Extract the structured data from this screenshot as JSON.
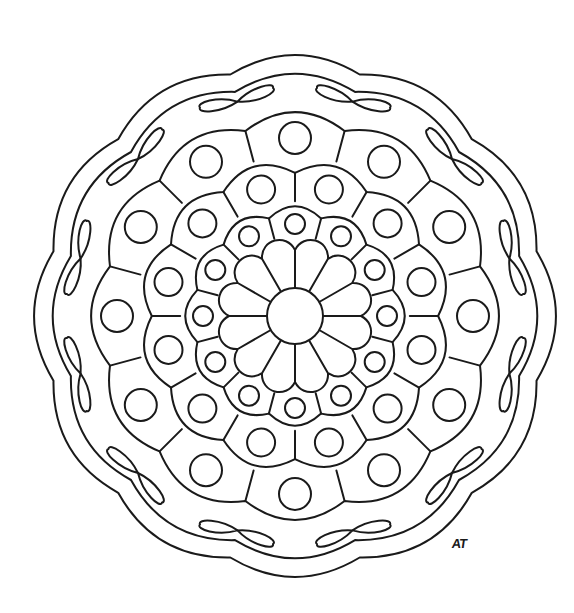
{
  "artwork": {
    "type": "mandala coloring page",
    "background": "#ffffff",
    "line_color": "#1a1a1a",
    "signature": "AT",
    "center": [
      295,
      316
    ],
    "symmetry": 12,
    "center_circle_radius": 28,
    "petals": {
      "count": 12,
      "outer_radius": 78,
      "offset_deg": 15
    },
    "ring_a": {
      "count": 12,
      "distance": 92,
      "circle_radius": 10,
      "cell_outer": 112,
      "offset_deg": 0
    },
    "ring_b": {
      "count": 12,
      "distance": 131,
      "circle_radius": 14,
      "cell_outer": 158,
      "offset_deg": 15
    },
    "ring_c": {
      "count": 12,
      "distance": 178,
      "circle_radius": 16,
      "cell_outer": 208,
      "offset_deg": 0
    },
    "outer_lobes": {
      "count": 12,
      "inner_outline_tip": 247,
      "inner_outline_notch": 232,
      "outer_outline_tip": 266,
      "outer_outline_notch": 250
    },
    "leaf_pairs": {
      "count": 12,
      "junction_distance": 222,
      "leaf_length": 34
    }
  }
}
